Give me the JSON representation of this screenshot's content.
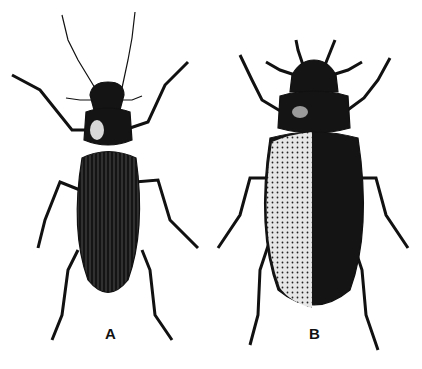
{
  "figure": {
    "specimens": [
      {
        "label": "A",
        "description": "elongate beetle, narrow pronotum, striate elytra"
      },
      {
        "label": "B",
        "description": "broad oval beetle, punctate-striate elytra"
      }
    ]
  },
  "colors": {
    "ink": "#111111",
    "background": "#ffffff",
    "highlight": "#e8e8e8"
  }
}
